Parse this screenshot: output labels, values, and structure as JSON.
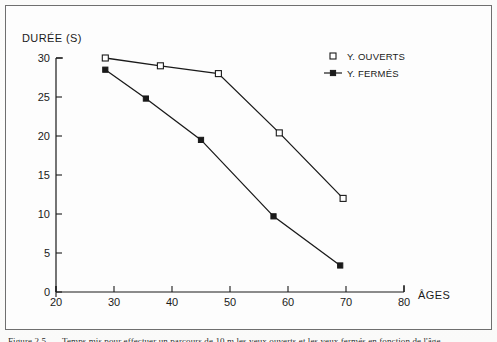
{
  "figure": {
    "frame_color": "#6f6f6f",
    "background": "#fdfdfd",
    "caption_fragment": "Figure 2.5. — Temps mis pour effectuer un parcours de 10 m les yeux ouverts et les yeux fermés en fonction de l'âge"
  },
  "chart_data": {
    "type": "line",
    "title": "",
    "ylabel": "DURÉE (S)",
    "xlabel": "ÂGES",
    "xlim": [
      20,
      80
    ],
    "ylim": [
      0,
      30
    ],
    "xticks": [
      20,
      30,
      40,
      50,
      60,
      70,
      80
    ],
    "yticks": [
      0,
      5,
      10,
      15,
      20,
      25,
      30
    ],
    "xtick_labels": [
      "20",
      "30",
      "40",
      "50",
      "60",
      "70",
      "80"
    ],
    "ytick_labels": [
      "0",
      "5",
      "10",
      "15",
      "20",
      "25",
      "30"
    ],
    "grid": false,
    "legend_position": "upper right inside",
    "series": [
      {
        "name": "Y. OUVERTS",
        "marker": "open-square",
        "color": "#1a1a1a",
        "x": [
          28.5,
          38.0,
          48.0,
          58.5,
          69.5
        ],
        "y": [
          30.0,
          29.0,
          28.0,
          20.4,
          12.0
        ]
      },
      {
        "name": "Y. FERMÉS",
        "marker": "filled-square",
        "color": "#1a1a1a",
        "x": [
          28.5,
          35.5,
          45.0,
          57.5,
          69.0
        ],
        "y": [
          28.5,
          24.8,
          19.5,
          9.7,
          3.4
        ]
      }
    ]
  },
  "legend": {
    "entries": [
      {
        "label": "Y. OUVERTS",
        "marker": "open-square"
      },
      {
        "label": "Y. FERMÉS",
        "marker": "filled-square-with-line"
      }
    ]
  }
}
